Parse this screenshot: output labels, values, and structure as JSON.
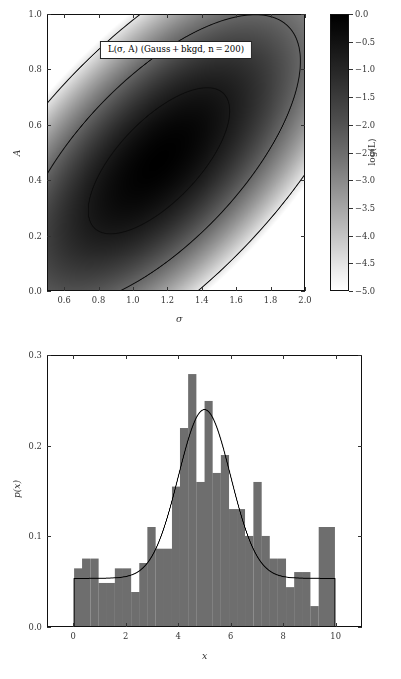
{
  "figure": {
    "background": "#ffffff",
    "foreground": "#111111",
    "bar_color": "#6e6e6e",
    "curve_color": "#000000"
  },
  "panels": {
    "likelihood": {
      "title": "L(σ, A) (Gauss + bkgd, n = 200)",
      "xlabel": "σ",
      "ylabel": "A",
      "xticks": [
        "0.6",
        "0.8",
        "1.0",
        "1.2",
        "1.4",
        "1.6",
        "1.8",
        "2.0"
      ],
      "yticks": [
        "0.0",
        "0.2",
        "0.4",
        "0.6",
        "0.8",
        "1.0"
      ],
      "colorbar": {
        "label": "log(L)",
        "ticks": [
          "0.0",
          "-0.5",
          "-1.0",
          "-1.5",
          "-2.0",
          "-2.5",
          "-3.0",
          "-3.5",
          "-4.0",
          "-4.5",
          "-5.0"
        ],
        "vmin": -5.0,
        "vmax": 0.0
      }
    },
    "histogram": {
      "xlabel": "x",
      "ylabel": "p(x)",
      "xticks": [
        "0",
        "2",
        "4",
        "6",
        "8",
        "10"
      ],
      "yticks": [
        "0.0",
        "0.1",
        "0.2",
        "0.3"
      ]
    }
  },
  "chart_data": [
    {
      "type": "heatmap",
      "title": "L(σ, A) (Gauss + bkgd, n = 200)",
      "xlabel": "σ",
      "ylabel": "A",
      "xlim": [
        0.5,
        2.0
      ],
      "ylim": [
        0.0,
        1.0
      ],
      "xticks": [
        0.6,
        0.8,
        1.0,
        1.2,
        1.4,
        1.6,
        1.8,
        2.0
      ],
      "yticks": [
        0.0,
        0.2,
        0.4,
        0.6,
        0.8,
        1.0
      ],
      "grid": false,
      "cmap": "binary_r_reversed_grayscale",
      "colorbar": {
        "label": "log(L)",
        "vmin": -5.0,
        "vmax": 0.0,
        "ticks": [
          0.0,
          -0.5,
          -1.0,
          -1.5,
          -2.0,
          -2.5,
          -3.0,
          -3.5,
          -4.0,
          -4.5,
          -5.0
        ],
        "position": "right"
      },
      "gaussian_model": {
        "mean_sigma": 1.15,
        "mean_A": 0.47,
        "std_major": 0.46,
        "std_minor": 0.175,
        "angle_deg": 28.0,
        "note": "log-likelihood surface peaks black at the centre and fades to white"
      },
      "contours": [
        {
          "name": "1-sigma",
          "n_std": 1.0,
          "level": -1.15
        },
        {
          "name": "2-sigma",
          "n_std": 2.0,
          "level": -3.1
        },
        {
          "name": "3-sigma",
          "n_std": 3.0,
          "level": -5.0
        }
      ]
    },
    {
      "type": "bar",
      "subtype": "histogram-with-fit",
      "title": "",
      "xlabel": "x",
      "ylabel": "p(x)",
      "xlim": [
        -1.0,
        11.0
      ],
      "ylim": [
        0.0,
        0.3
      ],
      "xticks": [
        0,
        2,
        4,
        6,
        8,
        10
      ],
      "yticks": [
        0.0,
        0.1,
        0.2,
        0.3
      ],
      "grid": false,
      "bin_width": 0.3125,
      "bin_edges": [
        0.0,
        0.3125,
        0.625,
        0.9375,
        1.25,
        1.5625,
        1.875,
        2.1875,
        2.5,
        2.8125,
        3.125,
        3.4375,
        3.75,
        4.0625,
        4.375,
        4.6875,
        5.0,
        5.3125,
        5.625,
        5.9375,
        6.25,
        6.5625,
        6.875,
        7.1875,
        7.5,
        7.8125,
        8.125,
        8.4375,
        8.75,
        9.0625,
        9.375,
        9.6875,
        10.0
      ],
      "values": [
        0.064,
        0.075,
        0.075,
        0.048,
        0.048,
        0.064,
        0.064,
        0.038,
        0.07,
        0.11,
        0.086,
        0.086,
        0.155,
        0.22,
        0.28,
        0.16,
        0.25,
        0.17,
        0.19,
        0.13,
        0.13,
        0.1,
        0.16,
        0.1,
        0.075,
        0.075,
        0.043,
        0.06,
        0.06,
        0.022,
        0.11,
        0.11
      ],
      "series": [
        {
          "name": "histogram of sampled data",
          "kind": "bar",
          "color": "#6e6e6e",
          "values": [
            0.064,
            0.075,
            0.075,
            0.048,
            0.048,
            0.064,
            0.064,
            0.038,
            0.07,
            0.11,
            0.086,
            0.086,
            0.155,
            0.22,
            0.28,
            0.16,
            0.25,
            0.17,
            0.19,
            0.13,
            0.13,
            0.1,
            0.16,
            0.1,
            0.075,
            0.075,
            0.043,
            0.06,
            0.06,
            0.022,
            0.11,
            0.11
          ]
        },
        {
          "name": "Gauss + background model",
          "kind": "line",
          "color": "#000000",
          "model": "A * N(mu, sigma) + (1 - A) / W",
          "A": 0.47,
          "mu": 5.0,
          "sigma": 1.0,
          "background_level": 0.053,
          "window": [
            0.0,
            10.0
          ],
          "peak_value": 0.24,
          "peak_x": 5.0
        }
      ]
    }
  ]
}
